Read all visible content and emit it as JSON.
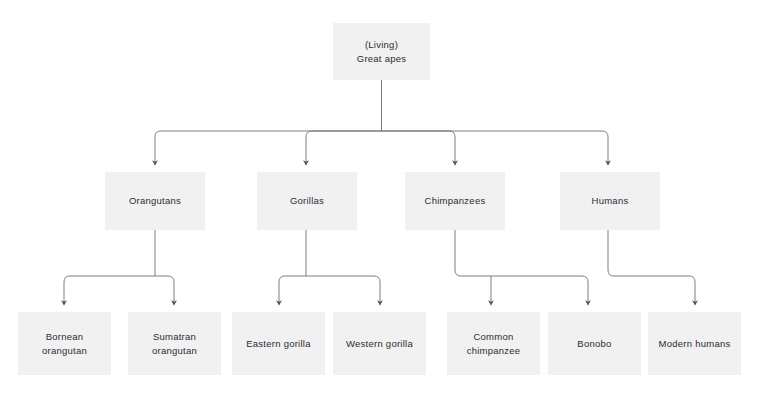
{
  "diagram": {
    "type": "hierarchy-tree",
    "title": "(Living) Great apes",
    "colors": {
      "node_fill": "#f1f1f1",
      "node_text": "#2b2b36",
      "connector": "#6f6f78",
      "background": "#ffffff"
    },
    "root": {
      "label": "(Living)\nGreat apes"
    },
    "level2": [
      {
        "label": "Orangutans"
      },
      {
        "label": "Gorillas"
      },
      {
        "label": "Chimpanzees"
      },
      {
        "label": "Humans"
      }
    ],
    "level3": [
      {
        "label": "Bornean\norangutan"
      },
      {
        "label": "Sumatran\norangutan"
      },
      {
        "label": "Eastern gorilla"
      },
      {
        "label": "Western gorilla"
      },
      {
        "label": "Common\nchimpanzee"
      },
      {
        "label": "Bonobo"
      },
      {
        "label": "Modern humans"
      }
    ]
  }
}
